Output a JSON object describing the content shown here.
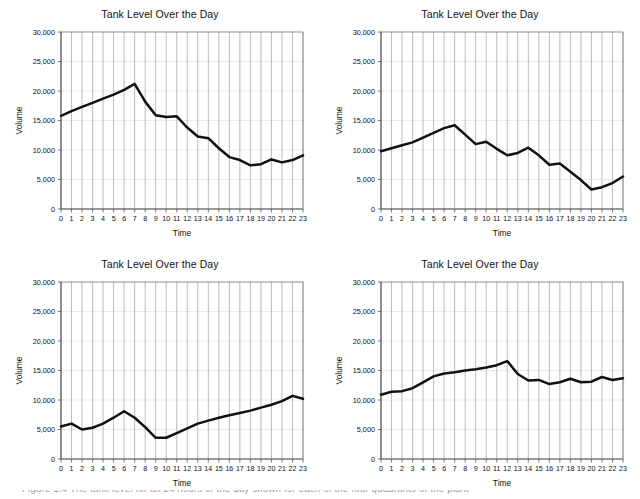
{
  "page": {
    "background_color": "#ffffff",
    "line_color": "#111111",
    "gridline_color": "#8e8e8e",
    "axis_color": "#555555",
    "cut_off_caption": "Figure 1.4  The tank level for all 24 hours of the day shown for each of the four quadrants of the plant"
  },
  "charts": [
    {
      "id": "chart-top-left",
      "position": "top-left",
      "chart_data": {
        "type": "line",
        "title": "Tank Level Over the Day",
        "xlabel": "Time",
        "ylabel": "Volume",
        "x": [
          0,
          1,
          2,
          3,
          4,
          5,
          6,
          7,
          8,
          9,
          10,
          11,
          12,
          13,
          14,
          15,
          16,
          17,
          18,
          19,
          20,
          21,
          22,
          23
        ],
        "xtick_labels": [
          "0",
          "1",
          "2",
          "3",
          "4",
          "5",
          "6",
          "7",
          "8",
          "9",
          "10",
          "11",
          "12",
          "13",
          "14",
          "15",
          "16",
          "17",
          "18",
          "19",
          "20",
          "21",
          "22",
          "23"
        ],
        "values": [
          15800,
          16600,
          17300,
          18000,
          18700,
          19400,
          20200,
          21200,
          18200,
          15900,
          15600,
          15700,
          13800,
          12300,
          12000,
          10300,
          8800,
          8300,
          7400,
          7600,
          8400,
          7900,
          8300,
          9100
        ],
        "ylim": [
          0,
          30000
        ],
        "ytick_labels": [
          "0",
          "5,000",
          "10,000",
          "15,000",
          "20,000",
          "25,000",
          "30,000"
        ],
        "yticks": [
          0,
          5000,
          10000,
          15000,
          20000,
          25000,
          30000
        ],
        "grid": true,
        "legend": "none"
      }
    },
    {
      "id": "chart-top-right",
      "position": "top-right",
      "chart_data": {
        "type": "line",
        "title": "Tank Level Over the Day",
        "xlabel": "Time",
        "ylabel": "Volume",
        "x": [
          0,
          1,
          2,
          3,
          4,
          5,
          6,
          7,
          8,
          9,
          10,
          11,
          12,
          13,
          14,
          15,
          16,
          17,
          18,
          19,
          20,
          21,
          22,
          23
        ],
        "xtick_labels": [
          "0",
          "1",
          "2",
          "3",
          "4",
          "5",
          "6",
          "7",
          "8",
          "9",
          "10",
          "11",
          "12",
          "13",
          "14",
          "15",
          "16",
          "17",
          "18",
          "19",
          "20",
          "21",
          "22",
          "23"
        ],
        "values": [
          9800,
          10300,
          10800,
          11300,
          12100,
          12900,
          13700,
          14200,
          12600,
          11000,
          11400,
          10200,
          9100,
          9500,
          10400,
          9100,
          7500,
          7700,
          6300,
          4900,
          3300,
          3700,
          4400,
          5500
        ],
        "ylim": [
          0,
          30000
        ],
        "ytick_labels": [
          "0",
          "5,000",
          "10,000",
          "15,000",
          "20,000",
          "25,000",
          "30,000"
        ],
        "yticks": [
          0,
          5000,
          10000,
          15000,
          20000,
          25000,
          30000
        ],
        "grid": true,
        "legend": "none"
      }
    },
    {
      "id": "chart-bottom-left",
      "position": "bottom-left",
      "chart_data": {
        "type": "line",
        "title": "Tank Level Over the Day",
        "xlabel": "Time",
        "ylabel": "Volume",
        "x": [
          0,
          1,
          2,
          3,
          4,
          5,
          6,
          7,
          8,
          9,
          10,
          11,
          12,
          13,
          14,
          15,
          16,
          17,
          18,
          19,
          20,
          21,
          22,
          23
        ],
        "xtick_labels": [
          "0",
          "1",
          "2",
          "3",
          "4",
          "5",
          "6",
          "7",
          "8",
          "9",
          "10",
          "11",
          "12",
          "13",
          "14",
          "15",
          "16",
          "17",
          "18",
          "19",
          "20",
          "21",
          "22",
          "23"
        ],
        "values": [
          5500,
          6000,
          5000,
          5300,
          6000,
          7000,
          8100,
          7000,
          5400,
          3600,
          3600,
          4400,
          5200,
          6000,
          6500,
          7000,
          7400,
          7800,
          8200,
          8700,
          9200,
          9800,
          10700,
          10200
        ],
        "ylim": [
          0,
          30000
        ],
        "ytick_labels": [
          "0",
          "5,000",
          "10,000",
          "15,000",
          "20,000",
          "25,000",
          "30,000"
        ],
        "yticks": [
          0,
          5000,
          10000,
          15000,
          20000,
          25000,
          30000
        ],
        "grid": true,
        "legend": "none"
      }
    },
    {
      "id": "chart-bottom-right",
      "position": "bottom-right",
      "chart_data": {
        "type": "line",
        "title": "Tank Level Over the Day",
        "xlabel": "Time",
        "ylabel": "Volume",
        "x": [
          0,
          1,
          2,
          3,
          4,
          5,
          6,
          7,
          8,
          9,
          10,
          11,
          12,
          13,
          14,
          15,
          16,
          17,
          18,
          19,
          20,
          21,
          22,
          23
        ],
        "xtick_labels": [
          "0",
          "1",
          "2",
          "3",
          "4",
          "5",
          "6",
          "7",
          "8",
          "9",
          "10",
          "11",
          "12",
          "13",
          "14",
          "15",
          "16",
          "17",
          "18",
          "19",
          "20",
          "21",
          "22",
          "23"
        ],
        "values": [
          10900,
          11400,
          11500,
          12000,
          13000,
          14000,
          14500,
          14700,
          15000,
          15200,
          15500,
          15900,
          16600,
          14400,
          13300,
          13400,
          12700,
          13000,
          13600,
          13000,
          13100,
          13900,
          13400,
          13700
        ],
        "ylim": [
          0,
          30000
        ],
        "ytick_labels": [
          "0",
          "5,000",
          "10,000",
          "15,000",
          "20,000",
          "25,000",
          "30,000"
        ],
        "yticks": [
          0,
          5000,
          10000,
          15000,
          20000,
          25000,
          30000
        ],
        "grid": true,
        "legend": "none"
      }
    }
  ]
}
